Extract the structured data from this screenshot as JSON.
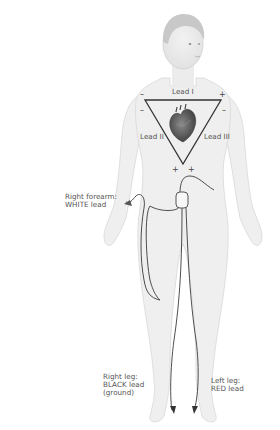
{
  "figure": {
    "triangle": {
      "name": "Einthoven's triangle",
      "leads": [
        {
          "id": "lead-1",
          "label": "Lead I"
        },
        {
          "id": "lead-2",
          "label": "Lead II"
        },
        {
          "id": "lead-3",
          "label": "Lead III"
        }
      ],
      "polarity": {
        "top_left_outer": "–",
        "top_right_outer": "+",
        "left_side": "–",
        "right_side": "–",
        "bottom_left": "+",
        "bottom_right": "+"
      }
    },
    "electrodes": [
      {
        "id": "right-forearm",
        "label": "Right forearm:\nWHITE lead"
      },
      {
        "id": "right-leg",
        "label": "Right leg:\nBLACK lead\n(ground)"
      },
      {
        "id": "left-leg",
        "label": "Left leg:\nRED lead"
      }
    ],
    "colors": {
      "body": "#efefef",
      "body_outline": "#d6d6d6",
      "triangle": "#333333",
      "wire": "#3a3a3a",
      "label_text": "#555555",
      "heart": "#5a5a5a"
    }
  }
}
